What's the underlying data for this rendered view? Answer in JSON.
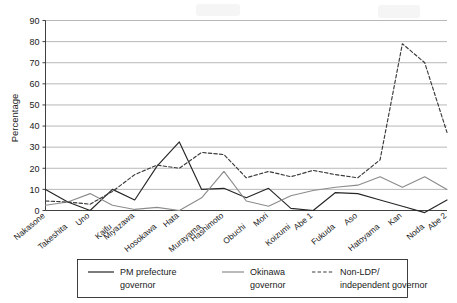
{
  "chart_data": {
    "type": "line",
    "title": "",
    "xlabel": "",
    "ylabel": "Percentage",
    "ylim": [
      0,
      90
    ],
    "yticks": [
      0,
      10,
      20,
      30,
      40,
      50,
      60,
      70,
      80,
      90
    ],
    "grid": true,
    "legend_position": "bottom",
    "categories": [
      "Nakasone",
      "Takeshita",
      "Uno",
      "Kaifu",
      "Miyazawa",
      "Hosokawa",
      "Hata",
      "Murayama",
      "Hashimoto",
      "Obuchi",
      "Mori",
      "Koizumi",
      "Abe 1",
      "Fukuda",
      "Aso",
      "Hatoyama",
      "Kan",
      "Noda",
      "Abe 2"
    ],
    "series": [
      {
        "name": "PM prefecture governor",
        "style": "solid",
        "color": "#262626",
        "values": [
          10,
          4,
          0,
          10,
          5,
          21,
          32.5,
          10,
          10.5,
          6,
          10.5,
          1,
          0,
          8.5,
          8,
          5,
          2,
          -1,
          5
        ]
      },
      {
        "name": "Okinawa governor",
        "style": "solid",
        "color": "#8c8c8c",
        "values": [
          2.5,
          4,
          8,
          2.5,
          0.5,
          1.5,
          0,
          6,
          18.5,
          4.5,
          2,
          7,
          9.5,
          11,
          12,
          16,
          11,
          16,
          10
        ]
      },
      {
        "name": "Non-LDP/independent governor",
        "style": "dashed",
        "color": "#3a3a3a",
        "values": [
          4.5,
          4,
          3,
          9,
          17,
          21.5,
          20,
          27.5,
          26.5,
          15.5,
          18.5,
          16,
          19,
          17,
          15.5,
          24,
          79,
          70,
          37
        ]
      }
    ]
  },
  "legend": {
    "items": [
      {
        "label_line1": "PM prefecture",
        "label_line2": "governor",
        "style": "solid",
        "color": "#262626"
      },
      {
        "label_line1": "Okinawa",
        "label_line2": "governor",
        "style": "solid",
        "color": "#8c8c8c"
      },
      {
        "label_line1": "Non-LDP/",
        "label_line2": "independent governor",
        "style": "dashed",
        "color": "#3a3a3a"
      }
    ]
  }
}
